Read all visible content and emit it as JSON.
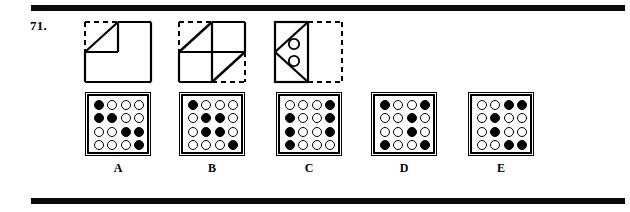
{
  "page": {
    "question_number": "71.",
    "rules": {
      "color": "#0a0a0a",
      "count": 2
    }
  },
  "problem_figures": [
    {
      "name": "figure-1",
      "description": "Large square; top-left quadrant outlined with dashed top and left edges and a diagonal from its lower-left to its upper-right corner."
    },
    {
      "name": "figure-2",
      "description": "Square divided into four quadrants; top-left quadrant has dashed top and left edges with a diagonal, bottom-right quadrant has dashed bottom and right edges with a diagonal."
    },
    {
      "name": "figure-3",
      "description": "Solid rectangle on the left containing a leftward-pointing triangle formed by two diagonals, with two small open circles inside; a dashed square sits to its right."
    }
  ],
  "options": [
    {
      "label": "A",
      "grid": [
        [
          1,
          0,
          0,
          0
        ],
        [
          1,
          1,
          0,
          0
        ],
        [
          0,
          0,
          1,
          1
        ],
        [
          0,
          0,
          0,
          1
        ]
      ]
    },
    {
      "label": "B",
      "grid": [
        [
          1,
          0,
          0,
          0
        ],
        [
          0,
          1,
          1,
          0
        ],
        [
          0,
          1,
          1,
          0
        ],
        [
          0,
          0,
          0,
          1
        ]
      ]
    },
    {
      "label": "C",
      "grid": [
        [
          0,
          0,
          0,
          1
        ],
        [
          1,
          0,
          0,
          1
        ],
        [
          1,
          0,
          0,
          1
        ],
        [
          1,
          0,
          0,
          0
        ]
      ]
    },
    {
      "label": "D",
      "grid": [
        [
          1,
          0,
          0,
          1
        ],
        [
          0,
          0,
          1,
          0
        ],
        [
          0,
          0,
          1,
          0
        ],
        [
          1,
          0,
          0,
          1
        ]
      ]
    },
    {
      "label": "E",
      "grid": [
        [
          0,
          0,
          1,
          1
        ],
        [
          0,
          1,
          0,
          0
        ],
        [
          0,
          1,
          0,
          0
        ],
        [
          0,
          0,
          1,
          1
        ]
      ]
    }
  ],
  "option_positions": [
    83,
    177,
    274,
    369,
    466
  ],
  "colors": {
    "ink": "#000000",
    "paper": "#ffffff",
    "rule": "#0a0a0a"
  }
}
